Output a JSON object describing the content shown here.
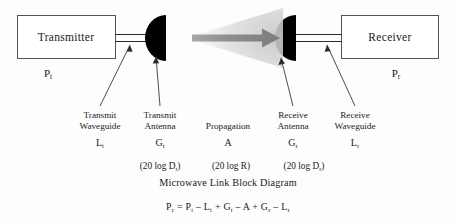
{
  "diagram": {
    "caption": "Microwave Link Block Diagram",
    "equation": "P_r = P_t – L_t + G_t – A + G_r – L_r",
    "colors": {
      "antenna_fill": "#000000",
      "box_stroke": "#555555",
      "beam_gray": "#cfcfcf",
      "arrow_gray": "#8c8c8c",
      "text": "#1a1a1a"
    },
    "blocks": [
      {
        "name": "transmitter",
        "label": "Transmitter",
        "power_symbol": "P",
        "power_subscript": "t"
      },
      {
        "name": "receiver",
        "label": "Receiver",
        "power_symbol": "P",
        "power_subscript": "r"
      }
    ],
    "components": [
      {
        "name": "transmit-waveguide",
        "line1": "Transmit",
        "line2": "Waveguide",
        "symbol": "L",
        "subscript": "t",
        "db": ""
      },
      {
        "name": "transmit-antenna",
        "line1": "Transmit",
        "line2": "Antenna",
        "symbol": "G",
        "subscript": "t",
        "db": "(20 log D",
        "db_sub": "t",
        "db_end": ")"
      },
      {
        "name": "propagation",
        "line1": "Propagation",
        "line2": "",
        "symbol": "A",
        "subscript": "",
        "db": "(20 log R",
        "db_sub": "",
        "db_end": ")"
      },
      {
        "name": "receive-antenna",
        "line1": "Receive",
        "line2": "Antenna",
        "symbol": "G",
        "subscript": "r",
        "db": "(20 log D",
        "db_sub": "r",
        "db_end": ")"
      },
      {
        "name": "receive-waveguide",
        "line1": "Receive",
        "line2": "Waveguide",
        "symbol": "L",
        "subscript": "r",
        "db": ""
      }
    ],
    "equation_parts": {
      "lhs_sym": "P",
      "lhs_sub": "r",
      "eq": "=",
      "t1_sym": "P",
      "t1_sub": "t",
      "op1": "–",
      "t2_sym": "L",
      "t2_sub": "t",
      "op2": "+",
      "t3_sym": "G",
      "t3_sub": "t",
      "op3": "–",
      "t4_sym": "A",
      "op4": "+",
      "t5_sym": "G",
      "t5_sub": "r",
      "op5": "–",
      "t6_sym": "L",
      "t6_sub": "r"
    }
  }
}
